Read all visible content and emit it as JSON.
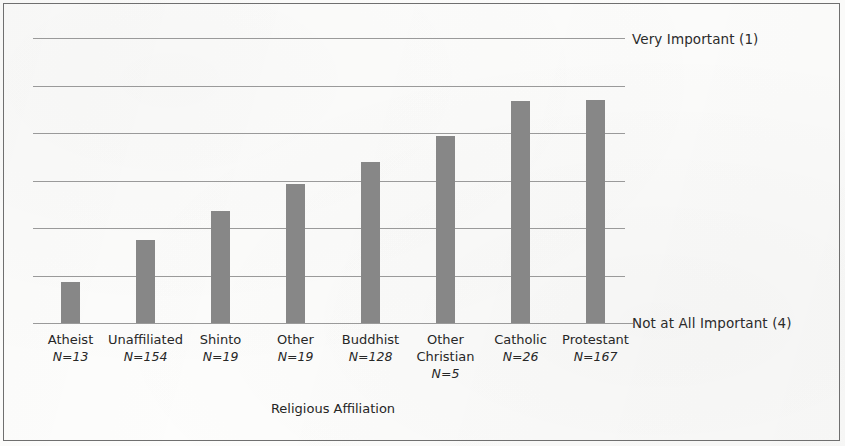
{
  "chart_data": {
    "type": "bar",
    "title": "",
    "xlabel": "Religious Affiliation",
    "ylabel": "",
    "orientation": "vertical",
    "grid": true,
    "legend": "none",
    "y_axis": {
      "top_label": "Very Important (1)",
      "bottom_label": "Not at All Important (4)",
      "scale_note": "Lower values = more important; bars grow downward-to-upward from the 'Not at All Important (4)' baseline",
      "ylim": [
        4,
        1
      ],
      "gridline_count": 7
    },
    "categories": [
      "Atheist",
      "Unaffiliated",
      "Shinto",
      "Other",
      "Buddhist",
      "Other Christian",
      "Catholic",
      "Protestant"
    ],
    "category_lines": [
      [
        "Atheist"
      ],
      [
        "Unaffiliated"
      ],
      [
        "Shinto"
      ],
      [
        "Other"
      ],
      [
        "Buddhist"
      ],
      [
        "Other",
        "Christian"
      ],
      [
        "Catholic"
      ],
      [
        "Protestant"
      ]
    ],
    "n_labels": [
      "N=13",
      "N=154",
      "N=19",
      "N=19",
      "N=128",
      "N=5",
      "N=26",
      "N=167"
    ],
    "n_values": [
      13,
      154,
      19,
      19,
      128,
      5,
      26,
      167
    ],
    "values": [
      3.45,
      3.1,
      2.85,
      2.62,
      2.47,
      2.3,
      2.06,
      2.05
    ],
    "bar_pixel_tops": [
      282,
      240,
      211,
      184,
      162,
      136,
      101,
      100
    ],
    "bar_color": "#878787",
    "gridline_color": "#9a9a9a",
    "baseline_y": 323
  },
  "figure": {
    "border_color": "#6f6f6f",
    "background": "#fdfdfc"
  }
}
